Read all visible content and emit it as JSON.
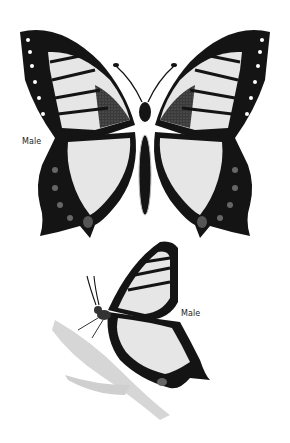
{
  "illustration": {
    "subject": "swallowtail-butterfly",
    "colors": {
      "background": "#ffffff",
      "wing_light": "#e6e6e6",
      "wing_dark": "#141414",
      "shading": "#555555"
    },
    "figures": [
      {
        "view": "dorsal-open-wings",
        "label": "Male"
      },
      {
        "view": "lateral-perched-on-stem",
        "label": "Male"
      }
    ]
  }
}
